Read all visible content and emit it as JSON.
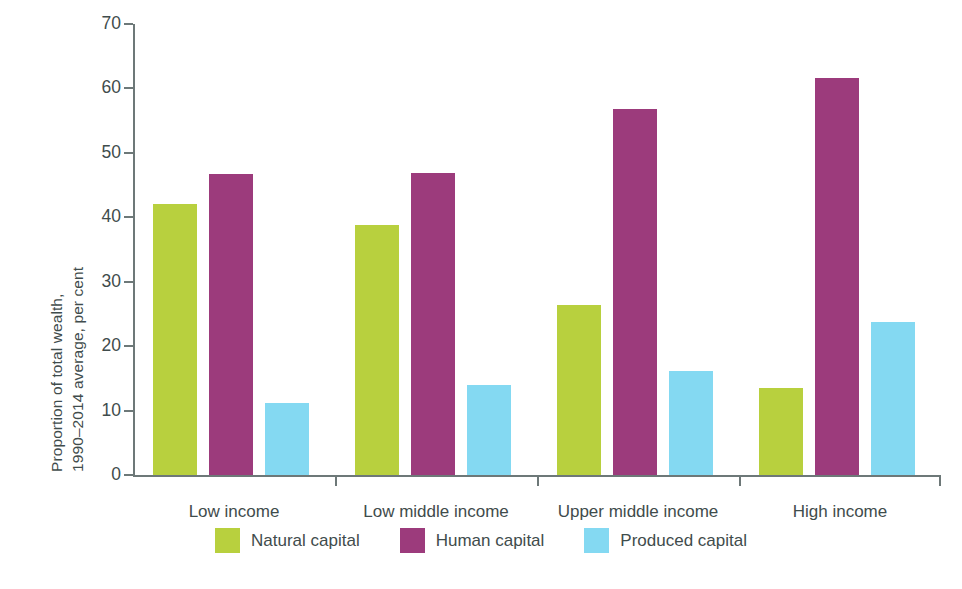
{
  "chart_data": {
    "type": "bar",
    "title": "",
    "subtitle": "",
    "xlabel": "",
    "ylabel": "Proportion of total wealth,\n1990–2014 average, per cent",
    "categories": [
      "Low income",
      "Low middle income",
      "Upper middle income",
      "High income"
    ],
    "series": [
      {
        "name": "Natural capital",
        "color": "#b8d03e",
        "values": [
          42.0,
          38.8,
          26.4,
          13.5
        ]
      },
      {
        "name": "Human capital",
        "color": "#9c3b7c",
        "values": [
          46.7,
          46.9,
          56.8,
          61.6
        ]
      },
      {
        "name": "Produced capital",
        "color": "#84d9f2",
        "values": [
          11.1,
          14.0,
          16.2,
          23.7
        ]
      }
    ],
    "ylim": [
      0,
      70
    ],
    "yticks": [
      0,
      10,
      20,
      30,
      40,
      50,
      60,
      70
    ],
    "ytick_labels": [
      "0",
      "10",
      "20",
      "30",
      "40",
      "50",
      "60",
      "70"
    ],
    "grid": false,
    "legend_position": "bottom",
    "axis_color": "#6d7878",
    "text_color": "#3f4c4c"
  }
}
